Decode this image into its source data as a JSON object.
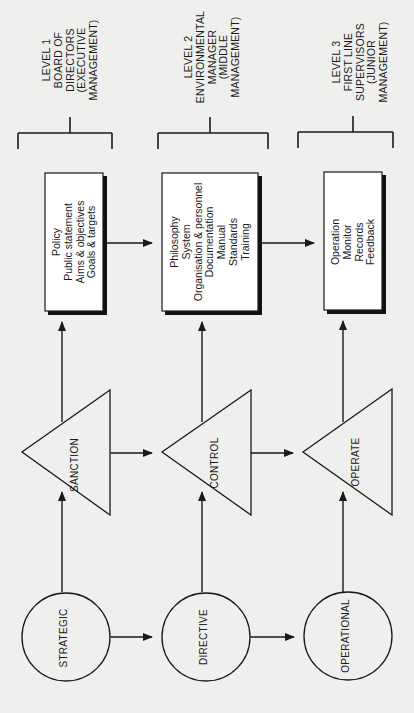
{
  "levels": [
    {
      "id": 1,
      "lines": [
        "LEVEL 1",
        "BOARD OF",
        "DIRECTORS",
        "(EXECUTIVE",
        "MANAGEMENT)"
      ],
      "box_items": [
        "Policy",
        "Public statement",
        "Aims & objectives",
        "Goals & targets"
      ],
      "triangle_label": "SANCTION",
      "circle_label": "STRATEGIC"
    },
    {
      "id": 2,
      "lines": [
        "LEVEL 2",
        "ENVIRONMENTAL",
        "MANAGER",
        "(MIDDLE",
        "MANAGEMENT)"
      ],
      "box_items": [
        "Philosophy",
        "System",
        "Organisation & personnel",
        "Documentation",
        "Manual",
        "Standards",
        "Training"
      ],
      "triangle_label": "CONTROL",
      "circle_label": "DIRECTIVE"
    },
    {
      "id": 3,
      "lines": [
        "LEVEL 3",
        "FIRST LINE",
        "SUPERVISORS",
        "(JUNIOR",
        "MANAGEMENT)"
      ],
      "box_items": [
        "Operation",
        "Monitor",
        "Records",
        "Feedback"
      ],
      "triangle_label": "OPERATE",
      "circle_label": "OPERATIONAL"
    }
  ],
  "colors": {
    "background": "#efefed",
    "ink": "#1a1a1a",
    "box_fill": "#ffffff"
  }
}
